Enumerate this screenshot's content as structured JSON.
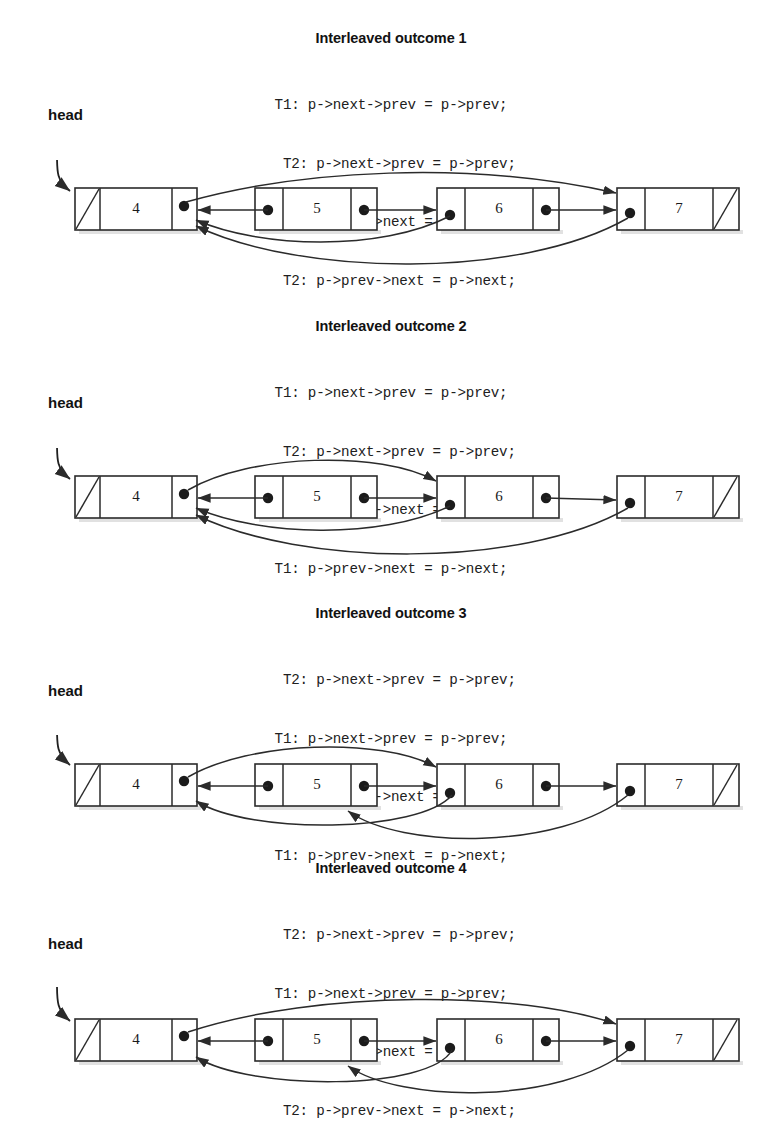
{
  "document": {
    "kind": "linked-list-interleaving-diagram",
    "node_values": [
      "4",
      "5",
      "6",
      "7"
    ],
    "head_label": "head",
    "null_cell_glyph": "diagonal-slash"
  },
  "panels": [
    {
      "id": "outcome-1",
      "title": "Interleaved outcome 1",
      "head_label": "head",
      "code_lines": [
        "T1: p->next->prev = p->prev;",
        "  T2: p->next->prev = p->prev;",
        "T1: p->prev->next = p->next;",
        "  T2: p->prev->next = p->next;"
      ],
      "nodes": [
        {
          "value": "4",
          "has_null_prev": true,
          "has_null_next": false
        },
        {
          "value": "5",
          "has_null_prev": false,
          "has_null_next": false
        },
        {
          "value": "6",
          "has_null_prev": false,
          "has_null_next": false
        },
        {
          "value": "7",
          "has_null_prev": false,
          "has_null_next": true
        }
      ]
    },
    {
      "id": "outcome-2",
      "title": "Interleaved outcome 2",
      "head_label": "head",
      "code_lines": [
        "T1: p->next->prev = p->prev;",
        "  T2: p->next->prev = p->prev;",
        "  T2: p->prev->next = p->next;",
        "T1: p->prev->next = p->next;"
      ],
      "nodes": [
        {
          "value": "4",
          "has_null_prev": true,
          "has_null_next": false
        },
        {
          "value": "5",
          "has_null_prev": false,
          "has_null_next": false
        },
        {
          "value": "6",
          "has_null_prev": false,
          "has_null_next": false
        },
        {
          "value": "7",
          "has_null_prev": false,
          "has_null_next": true
        }
      ]
    },
    {
      "id": "outcome-3",
      "title": "Interleaved outcome 3",
      "head_label": "head",
      "code_lines": [
        "  T2: p->next->prev = p->prev;",
        "T1: p->next->prev = p->prev;",
        "  T2: p->prev->next = p->next;",
        "T1: p->prev->next = p->next;"
      ],
      "nodes": [
        {
          "value": "4",
          "has_null_prev": true,
          "has_null_next": false
        },
        {
          "value": "5",
          "has_null_prev": false,
          "has_null_next": false
        },
        {
          "value": "6",
          "has_null_prev": false,
          "has_null_next": false
        },
        {
          "value": "7",
          "has_null_prev": false,
          "has_null_next": true
        }
      ]
    },
    {
      "id": "outcome-4",
      "title": "Interleaved outcome 4",
      "head_label": "head",
      "code_lines": [
        "  T2: p->next->prev = p->prev;",
        "T1: p->next->prev = p->prev;",
        "T1: p->prev->next = p->next;",
        "  T2: p->prev->next = p->next;"
      ],
      "nodes": [
        {
          "value": "4",
          "has_null_prev": true,
          "has_null_next": false
        },
        {
          "value": "5",
          "has_null_prev": false,
          "has_null_next": false
        },
        {
          "value": "6",
          "has_null_prev": false,
          "has_null_next": false
        },
        {
          "value": "7",
          "has_null_prev": false,
          "has_null_next": true
        }
      ]
    }
  ],
  "colors": {
    "ink": "#2b2b2b",
    "text": "#121212",
    "paper": "#ffffff",
    "shadow": "#c9c9c9"
  }
}
